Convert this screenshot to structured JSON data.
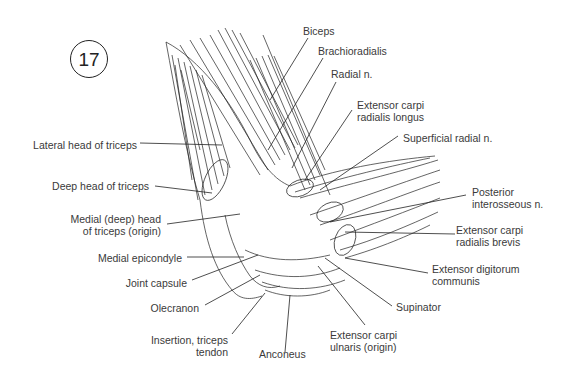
{
  "figure": {
    "number": "17",
    "type": "anatomical illustration"
  },
  "labels": {
    "biceps": "Biceps",
    "brachioradialis": "Brachioradialis",
    "radial_n": "Radial n.",
    "ecrl_1": "Extensor carpi",
    "ecrl_2": "radialis longus",
    "superficial_radial_n": "Superficial radial n.",
    "posterior_interosseous_1": "Posterior",
    "posterior_interosseous_2": "interosseous n.",
    "ecrb_1": "Extensor carpi",
    "ecrb_2": "radialis brevis",
    "edc_1": "Extensor digitorum",
    "edc_2": "communis",
    "supinator": "Supinator",
    "ecu_1": "Extensor carpi",
    "ecu_2": "ulnaris (origin)",
    "anconeus": "Anconeus",
    "insertion_1": "Insertion, triceps",
    "insertion_2": "tendon",
    "olecranon": "Olecranon",
    "joint_capsule": "Joint capsule",
    "medial_epicondyle": "Medial epicondyle",
    "medial_head_1": "Medial (deep) head",
    "medial_head_2": "of triceps (origin)",
    "deep_head": "Deep head of triceps",
    "lateral_head": "Lateral head of triceps"
  },
  "colors": {
    "ink": "#222222",
    "text": "#3a3a3a",
    "background": "#ffffff"
  }
}
